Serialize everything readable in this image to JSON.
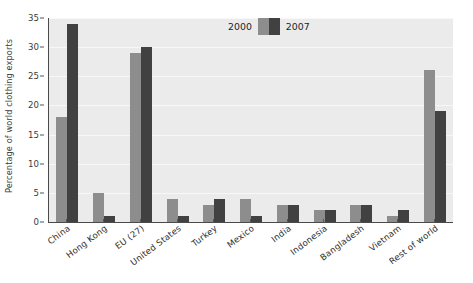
{
  "chart_data": {
    "type": "bar",
    "title": "",
    "xlabel": "",
    "ylabel": "Percentage of world clothing exports",
    "ylim": [
      0,
      35
    ],
    "ytick_labels": [
      "0",
      "5",
      "10",
      "15",
      "20",
      "25",
      "30",
      "35"
    ],
    "ytick_values": [
      0,
      5,
      10,
      15,
      20,
      25,
      30,
      35
    ],
    "grid": true,
    "legend_position": "top-center",
    "categories": [
      "China",
      "Hong Kong",
      "EU (27)",
      "United States",
      "Turkey",
      "Mexico",
      "India",
      "Indonesia",
      "Bangladesh",
      "Vietnam",
      "Rest of world"
    ],
    "series": [
      {
        "name": "2000",
        "color": "#8d8d8d",
        "values": [
          18,
          5,
          29,
          4,
          3,
          4,
          3,
          2,
          3,
          1,
          26
        ]
      },
      {
        "name": "2007",
        "color": "#414141",
        "values": [
          34,
          1,
          30,
          1,
          4,
          1,
          3,
          2,
          3,
          2,
          19
        ]
      }
    ]
  },
  "legend": {
    "left_label": "2000",
    "right_label": "2007"
  },
  "colors": {
    "series_2000": "#8d8d8d",
    "series_2007": "#414141",
    "plot_background": "#ebebeb",
    "axis": "#4a4a4a",
    "gridline": "#f7f7f7",
    "text": "#2e2e2e"
  }
}
